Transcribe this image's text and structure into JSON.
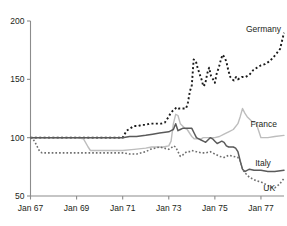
{
  "chart_data": {
    "type": "line",
    "title": "",
    "subtitle": "",
    "xlabel": "",
    "ylabel": "",
    "xlim": [
      1967.0,
      1978.0
    ],
    "ylim": [
      50,
      200
    ],
    "grid": false,
    "legend_position": "inline-right-end-of-line",
    "y_ticks": [
      50,
      100,
      150,
      200
    ],
    "y_tick_labels": [
      "50",
      "100",
      "150",
      "200"
    ],
    "x_ticks": [
      1967.0,
      1969.0,
      1971.0,
      1973.0,
      1975.0,
      1977.0
    ],
    "x_tick_labels": [
      "Jan 67",
      "Jan 69",
      "Jan 71",
      "Jan 73",
      "Jan 75",
      "Jan 77"
    ],
    "series": [
      {
        "name": "Germany",
        "label": "Germany",
        "color": "#1a1a1a",
        "style": "dotted",
        "width": 1.9,
        "label_x": 1976.35,
        "label_y": 193,
        "x": [
          1967.0,
          1967.25,
          1967.5,
          1967.75,
          1968.0,
          1968.25,
          1968.5,
          1968.75,
          1969.0,
          1969.25,
          1969.5,
          1969.75,
          1970.0,
          1970.25,
          1970.5,
          1970.75,
          1971.0,
          1971.17,
          1971.33,
          1971.5,
          1971.67,
          1971.83,
          1972.0,
          1972.17,
          1972.33,
          1972.5,
          1972.67,
          1972.83,
          1973.0,
          1973.08,
          1973.17,
          1973.25,
          1973.33,
          1973.42,
          1973.5,
          1973.58,
          1973.67,
          1973.75,
          1973.83,
          1973.92,
          1974.0,
          1974.08,
          1974.17,
          1974.25,
          1974.33,
          1974.42,
          1974.5,
          1974.58,
          1974.67,
          1974.75,
          1974.83,
          1974.92,
          1975.0,
          1975.08,
          1975.17,
          1975.25,
          1975.33,
          1975.42,
          1975.5,
          1975.58,
          1975.67,
          1975.75,
          1975.83,
          1975.92,
          1976.0,
          1976.17,
          1976.33,
          1976.5,
          1976.67,
          1976.83,
          1977.0,
          1977.17,
          1977.33,
          1977.5,
          1977.67,
          1977.83,
          1978.0
        ],
        "y": [
          100,
          100,
          100,
          100,
          100,
          100,
          100,
          100,
          100,
          100,
          100,
          100,
          100,
          100,
          100,
          100,
          100,
          106,
          108,
          110,
          110,
          111,
          111,
          112,
          112,
          112,
          112,
          113,
          118,
          121,
          123,
          124,
          126,
          125,
          125,
          125,
          125,
          125,
          130,
          140,
          145,
          167,
          166,
          160,
          155,
          150,
          144,
          146,
          155,
          160,
          153,
          150,
          147,
          155,
          160,
          166,
          171,
          169,
          165,
          158,
          152,
          150,
          149,
          152,
          150,
          152,
          152,
          154,
          158,
          160,
          162,
          163,
          165,
          168,
          172,
          176,
          190
        ]
      },
      {
        "name": "France",
        "label": "France",
        "color": "#bdbdbd",
        "style": "solid",
        "width": 1.4,
        "label_x": 1976.55,
        "label_y": 112,
        "x": [
          1967.0,
          1967.5,
          1968.0,
          1968.5,
          1969.0,
          1969.3,
          1969.5,
          1969.6,
          1969.75,
          1970.0,
          1970.5,
          1971.0,
          1971.5,
          1972.0,
          1972.25,
          1972.5,
          1972.75,
          1973.0,
          1973.1,
          1973.2,
          1973.3,
          1973.4,
          1973.5,
          1973.6,
          1973.7,
          1973.8,
          1973.9,
          1974.0,
          1974.1,
          1974.2,
          1974.3,
          1974.4,
          1974.5,
          1974.6,
          1974.7,
          1974.8,
          1974.9,
          1975.0,
          1975.2,
          1975.4,
          1975.6,
          1975.8,
          1976.0,
          1976.1,
          1976.2,
          1976.3,
          1976.4,
          1976.5,
          1976.6,
          1976.8,
          1977.0,
          1977.3,
          1977.6,
          1978.0
        ],
        "y": [
          100,
          100,
          100,
          100,
          100,
          99,
          92,
          89,
          89,
          89,
          89,
          89,
          90,
          91,
          92,
          92,
          92,
          93,
          97,
          112,
          120,
          119,
          112,
          110,
          108,
          107,
          104,
          101,
          99,
          99,
          99,
          99,
          100,
          100,
          100,
          100,
          100,
          100,
          101,
          103,
          105,
          107,
          112,
          118,
          125,
          121,
          118,
          116,
          114,
          112,
          100,
          100,
          101,
          102
        ]
      },
      {
        "name": "Italy",
        "label": "Italy",
        "color": "#5a5a5a",
        "style": "solid",
        "width": 1.5,
        "label_x": 1976.75,
        "label_y": 78,
        "x": [
          1967.0,
          1967.5,
          1968.0,
          1968.5,
          1969.0,
          1969.5,
          1970.0,
          1970.5,
          1971.0,
          1971.3,
          1971.6,
          1972.0,
          1972.3,
          1972.6,
          1973.0,
          1973.1,
          1973.2,
          1973.3,
          1973.4,
          1973.5,
          1973.6,
          1973.7,
          1973.8,
          1973.9,
          1974.0,
          1974.1,
          1974.2,
          1974.3,
          1974.4,
          1974.5,
          1974.6,
          1974.7,
          1974.8,
          1974.9,
          1975.0,
          1975.1,
          1975.2,
          1975.3,
          1975.4,
          1975.5,
          1975.6,
          1975.7,
          1975.8,
          1975.9,
          1976.0,
          1976.1,
          1976.2,
          1976.3,
          1976.4,
          1976.5,
          1976.7,
          1977.0,
          1977.3,
          1977.6,
          1978.0
        ],
        "y": [
          100,
          100,
          100,
          100,
          100,
          100,
          100,
          100,
          100,
          101,
          101,
          102,
          103,
          104,
          105,
          106,
          107,
          112,
          106,
          107,
          108,
          108,
          108,
          108,
          108,
          104,
          100,
          99,
          98,
          97,
          96,
          98,
          100,
          99,
          97,
          95,
          96,
          97,
          96,
          93,
          92,
          92,
          92,
          91,
          88,
          80,
          73,
          71,
          72,
          73,
          72,
          72,
          71,
          71,
          72
        ]
      },
      {
        "name": "UK",
        "label": "UK",
        "color": "#6e6e6e",
        "style": "dotted",
        "width": 1.6,
        "label_x": 1977.1,
        "label_y": 57,
        "x": [
          1967.0,
          1967.1,
          1967.2,
          1967.3,
          1967.4,
          1967.5,
          1967.75,
          1968.0,
          1968.5,
          1969.0,
          1969.5,
          1970.0,
          1970.5,
          1971.0,
          1971.3,
          1971.6,
          1972.0,
          1972.2,
          1972.4,
          1972.6,
          1972.8,
          1973.0,
          1973.1,
          1973.2,
          1973.3,
          1973.4,
          1973.5,
          1973.6,
          1973.7,
          1973.8,
          1973.9,
          1974.0,
          1974.2,
          1974.4,
          1974.6,
          1974.8,
          1975.0,
          1975.2,
          1975.4,
          1975.6,
          1975.8,
          1976.0,
          1976.1,
          1976.2,
          1976.3,
          1976.4,
          1976.5,
          1976.6,
          1976.8,
          1977.0,
          1977.2,
          1977.4,
          1977.6,
          1977.8,
          1978.0
        ],
        "y": [
          100,
          99,
          96,
          92,
          88,
          87,
          87,
          87,
          87,
          87,
          87,
          87,
          87,
          87,
          86,
          86,
          88,
          90,
          91,
          92,
          91,
          90,
          91,
          93,
          92,
          88,
          84,
          85,
          87,
          88,
          88,
          89,
          88,
          87,
          87,
          88,
          86,
          84,
          83,
          85,
          84,
          83,
          80,
          73,
          70,
          68,
          66,
          65,
          63,
          62,
          60,
          58,
          57,
          60,
          65
        ]
      }
    ]
  },
  "axis": {
    "y_labels": [
      "200",
      "150",
      "100",
      "50"
    ],
    "x_labels": [
      "Jan 67",
      "Jan 69",
      "Jan 71",
      "Jan 73",
      "Jan 75",
      "Jan 77"
    ]
  },
  "labels": {
    "germany": "Germany",
    "france": "France",
    "italy": "Italy",
    "uk": "UK"
  }
}
